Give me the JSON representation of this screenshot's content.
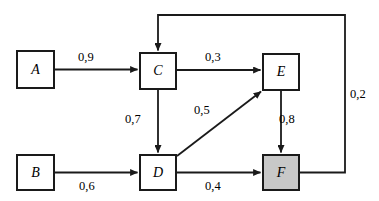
{
  "diagram": {
    "stroke_color": "#1a1a1a",
    "node_fill_default": "#ffffff",
    "node_fill_highlight": "#c8c8c8",
    "nodes": [
      {
        "id": "A",
        "label": "A",
        "x": 16,
        "y": 50,
        "w": 39,
        "h": 39,
        "highlighted": false
      },
      {
        "id": "B",
        "label": "B",
        "x": 16,
        "y": 154,
        "w": 39,
        "h": 37,
        "highlighted": false
      },
      {
        "id": "C",
        "label": "C",
        "x": 139,
        "y": 52,
        "w": 38,
        "h": 38,
        "highlighted": false
      },
      {
        "id": "D",
        "label": "D",
        "x": 139,
        "y": 154,
        "w": 38,
        "h": 37,
        "highlighted": false
      },
      {
        "id": "E",
        "label": "E",
        "x": 262,
        "y": 53,
        "w": 38,
        "h": 38,
        "highlighted": false
      },
      {
        "id": "F",
        "label": "F",
        "x": 262,
        "y": 154,
        "w": 38,
        "h": 37,
        "highlighted": true
      }
    ],
    "edges": [
      {
        "id": "A-C",
        "from": "A",
        "to": "C",
        "weight": "0,9",
        "label_x": 78,
        "label_y": 51
      },
      {
        "id": "C-E",
        "from": "C",
        "to": "E",
        "weight": "0,3",
        "label_x": 205,
        "label_y": 51
      },
      {
        "id": "C-D",
        "from": "C",
        "to": "D",
        "weight": "0,7",
        "label_x": 125,
        "label_y": 113
      },
      {
        "id": "D-E",
        "from": "D",
        "to": "E",
        "weight": "0,5",
        "label_x": 194,
        "label_y": 104
      },
      {
        "id": "E-F",
        "from": "E",
        "to": "F",
        "weight": "0,8",
        "label_x": 279,
        "label_y": 113
      },
      {
        "id": "B-D",
        "from": "B",
        "to": "D",
        "weight": "0,6",
        "label_x": 79,
        "label_y": 180
      },
      {
        "id": "D-F",
        "from": "D",
        "to": "F",
        "weight": "0,4",
        "label_x": 205,
        "label_y": 180
      },
      {
        "id": "F-C",
        "from": "F",
        "to": "C",
        "weight": "0,2",
        "label_x": 350,
        "label_y": 88
      }
    ]
  }
}
